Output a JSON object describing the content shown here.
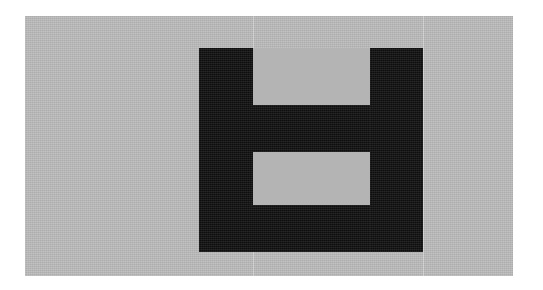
{
  "image": {
    "title": "Abstract black geometric pictogram on gray panel",
    "width": 543,
    "height": 290,
    "background_color": "#ffffff",
    "description": "A thick black glyph resembling a lowercase b / capital H with a closed lower counter, centered on a flat light-gray rectangular panel."
  },
  "panel": {
    "name": "gray-panel",
    "fill_color": "#b4b4b4",
    "x": 25,
    "y": 16,
    "width": 488,
    "height": 260,
    "seams": [
      {
        "x": 253,
        "y": 16,
        "height": 260
      },
      {
        "x": 423,
        "y": 16,
        "height": 260
      }
    ]
  },
  "glyph": {
    "name": "black-glyph",
    "fill_color": "#111111",
    "bounds": {
      "x": 199,
      "y": 48,
      "width": 224,
      "height": 204
    },
    "parts": [
      {
        "label": "left-stem",
        "x": 199,
        "y": 48,
        "width": 54,
        "height": 204
      },
      {
        "label": "right-stem",
        "x": 370,
        "y": 48,
        "width": 53,
        "height": 204
      },
      {
        "label": "crossbar",
        "x": 253,
        "y": 105,
        "width": 117,
        "height": 47
      },
      {
        "label": "bottom-bar",
        "x": 253,
        "y": 205,
        "width": 117,
        "height": 47
      }
    ],
    "counters": [
      {
        "label": "upper-notch",
        "x": 253,
        "y": 48,
        "width": 117,
        "height": 57,
        "fill_color": "#b4b4b4"
      },
      {
        "label": "lower-counter",
        "x": 253,
        "y": 152,
        "width": 117,
        "height": 53,
        "fill_color": "#b4b4b4"
      }
    ]
  }
}
